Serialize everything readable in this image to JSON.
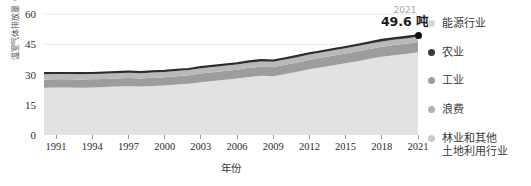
{
  "chart_data": {
    "type": "area",
    "title": "",
    "xlabel": "年份",
    "ylabel": "温室气体排放量（吨/人）",
    "xlim": [
      1990,
      2021
    ],
    "ylim": [
      0,
      63
    ],
    "grid": true,
    "legend_position": "right",
    "x_ticks": [
      "1991",
      "1994",
      "1997",
      "2000",
      "2003",
      "2006",
      "2009",
      "2012",
      "2015",
      "2018",
      "2021"
    ],
    "y_ticks": [
      "0",
      "15",
      "30",
      "45",
      "60"
    ],
    "x": [
      1990,
      1991,
      1992,
      1993,
      1994,
      1995,
      1996,
      1997,
      1998,
      1999,
      2000,
      2001,
      2002,
      2003,
      2004,
      2005,
      2006,
      2007,
      2008,
      2009,
      2010,
      2011,
      2012,
      2013,
      2014,
      2015,
      2016,
      2017,
      2018,
      2019,
      2020,
      2021
    ],
    "series": [
      {
        "name": "林业和其他土地利用行业",
        "color": "#e2e2e2",
        "values": [
          23.5,
          23.6,
          23.6,
          23.5,
          23.6,
          23.8,
          24.0,
          24.2,
          24.0,
          24.3,
          24.6,
          25.0,
          25.4,
          26.2,
          26.8,
          27.4,
          28.0,
          28.8,
          29.4,
          29.2,
          30.2,
          31.4,
          32.6,
          33.6,
          34.6,
          35.6,
          36.6,
          37.8,
          38.8,
          39.6,
          40.2,
          41.0
        ]
      },
      {
        "name": "浪费",
        "color": "#9d9d9d",
        "values": [
          4.0,
          4.0,
          4.0,
          4.0,
          4.0,
          4.0,
          4.0,
          4.1,
          4.0,
          4.1,
          4.1,
          4.2,
          4.2,
          4.3,
          4.3,
          4.4,
          4.4,
          4.5,
          4.5,
          4.5,
          4.6,
          4.6,
          4.7,
          4.7,
          4.8,
          4.8,
          4.9,
          4.9,
          5.0,
          5.0,
          5.1,
          5.1
        ]
      },
      {
        "name": "工业",
        "color": "#b9b9b9",
        "values": [
          2.6,
          2.6,
          2.6,
          2.6,
          2.6,
          2.6,
          2.6,
          2.6,
          2.6,
          2.6,
          2.6,
          2.6,
          2.6,
          2.6,
          2.6,
          2.6,
          2.6,
          2.6,
          2.6,
          2.6,
          2.6,
          2.6,
          2.6,
          2.6,
          2.6,
          2.6,
          2.6,
          2.6,
          2.6,
          2.6,
          2.6,
          2.6
        ]
      },
      {
        "name": "农业",
        "color": "#3a3a3a",
        "values": [
          0.7,
          0.7,
          0.7,
          0.7,
          0.7,
          0.7,
          0.7,
          0.7,
          0.7,
          0.7,
          0.7,
          0.7,
          0.7,
          0.7,
          0.7,
          0.7,
          0.7,
          0.8,
          0.8,
          0.8,
          0.8,
          0.8,
          0.8,
          0.8,
          0.8,
          0.8,
          0.8,
          0.8,
          0.9,
          0.9,
          0.9,
          0.9
        ]
      },
      {
        "name": "能源行业",
        "color": "#efefef",
        "values": [
          0.0,
          0.0,
          0.0,
          0.0,
          0.0,
          0.0,
          0.0,
          0.0,
          0.0,
          0.0,
          0.0,
          0.0,
          0.0,
          0.0,
          0.0,
          0.0,
          0.0,
          0.0,
          0.0,
          0.0,
          0.0,
          0.0,
          0.0,
          0.0,
          0.0,
          0.0,
          0.0,
          0.0,
          0.0,
          0.0,
          0.0,
          0.0
        ]
      }
    ],
    "totals": [
      30.8,
      30.9,
      30.9,
      30.8,
      30.9,
      31.1,
      31.3,
      31.6,
      31.3,
      31.7,
      32.0,
      32.5,
      32.9,
      33.8,
      34.4,
      35.1,
      35.7,
      36.7,
      37.3,
      37.1,
      38.2,
      39.4,
      40.7,
      41.7,
      42.8,
      43.8,
      44.9,
      46.1,
      47.3,
      48.1,
      48.8,
      49.6
    ],
    "annotation": {
      "year": "2021",
      "value": "49.6 吨",
      "point_x": 2021,
      "point_y": 49.6
    }
  },
  "legend": {
    "items": [
      {
        "label": "能源行业",
        "color": "#d6d6d6"
      },
      {
        "label": "农业",
        "color": "#3a3a3a"
      },
      {
        "label": "工业",
        "color": "#9d9d9d"
      },
      {
        "label": "浪费",
        "color": "#b0b0b0"
      },
      {
        "label": "林业和其他\n土地利用行业",
        "color": "#c9c9c9"
      }
    ]
  }
}
